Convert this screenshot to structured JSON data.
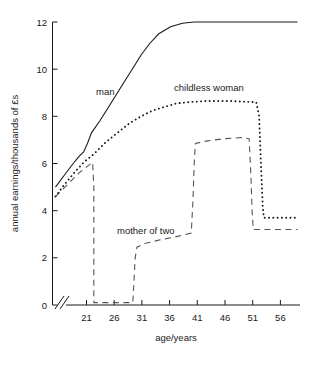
{
  "chart_data": {
    "type": "line",
    "title": "",
    "xlabel": "age/years",
    "ylabel": "annual earnings/thousands of £s",
    "xlim": [
      18,
      60
    ],
    "ylim": [
      0,
      12
    ],
    "xticks": [
      21,
      26,
      31,
      36,
      41,
      46,
      51,
      56
    ],
    "yticks": [
      0,
      2,
      4,
      6,
      8,
      10,
      12
    ],
    "grid": false,
    "legend": "inline-annotations",
    "axis_break": "x-axis broken between origin and first tick",
    "annotations": [
      {
        "text": "man",
        "x": 27.5,
        "y": 9.2
      },
      {
        "text": "childless woman",
        "x": 43.5,
        "y": 9.9
      },
      {
        "text": "mother of two",
        "x": 32.5,
        "y": 3.6
      }
    ],
    "series": [
      {
        "name": "man",
        "style": "solid",
        "points": [
          [
            18.5,
            5.0
          ],
          [
            20.0,
            5.5
          ],
          [
            21.5,
            6.0
          ],
          [
            22.5,
            6.3
          ],
          [
            23.3,
            6.5
          ],
          [
            24.0,
            6.9
          ],
          [
            24.6,
            7.3
          ],
          [
            26.0,
            7.8
          ],
          [
            28.0,
            8.6
          ],
          [
            30.0,
            9.4
          ],
          [
            31.5,
            10.0
          ],
          [
            33.0,
            10.6
          ],
          [
            34.5,
            11.1
          ],
          [
            36.0,
            11.5
          ],
          [
            38.0,
            11.8
          ],
          [
            40.0,
            11.95
          ],
          [
            42.0,
            12.0
          ],
          [
            46.0,
            12.0
          ],
          [
            52.0,
            12.0
          ],
          [
            59.5,
            12.0
          ]
        ]
      },
      {
        "name": "childless woman",
        "style": "dotted",
        "points": [
          [
            18.5,
            4.6
          ],
          [
            20.0,
            5.1
          ],
          [
            22.0,
            5.7
          ],
          [
            23.5,
            6.1
          ],
          [
            25.0,
            6.4
          ],
          [
            27.0,
            6.9
          ],
          [
            29.0,
            7.3
          ],
          [
            31.0,
            7.7
          ],
          [
            33.0,
            8.0
          ],
          [
            35.0,
            8.25
          ],
          [
            37.0,
            8.4
          ],
          [
            39.0,
            8.55
          ],
          [
            41.0,
            8.6
          ],
          [
            44.0,
            8.65
          ],
          [
            48.0,
            8.65
          ],
          [
            52.5,
            8.6
          ],
          [
            53.0,
            8.0
          ],
          [
            53.3,
            6.0
          ],
          [
            53.6,
            4.2
          ],
          [
            53.8,
            3.7
          ],
          [
            55.0,
            3.7
          ],
          [
            59.5,
            3.7
          ]
        ]
      },
      {
        "name": "mother of two",
        "style": "dashed",
        "points": [
          [
            18.5,
            4.6
          ],
          [
            20.5,
            5.1
          ],
          [
            22.5,
            5.6
          ],
          [
            24.0,
            5.9
          ],
          [
            24.8,
            6.05
          ],
          [
            25.0,
            5.0
          ],
          [
            25.0,
            2.0
          ],
          [
            25.0,
            0.1
          ],
          [
            26.0,
            0.1
          ],
          [
            29.0,
            0.1
          ],
          [
            31.0,
            0.1
          ],
          [
            31.6,
            0.1
          ],
          [
            31.8,
            1.0
          ],
          [
            32.0,
            2.0
          ],
          [
            32.3,
            2.45
          ],
          [
            33.5,
            2.6
          ],
          [
            36.0,
            2.75
          ],
          [
            39.0,
            2.9
          ],
          [
            41.5,
            3.05
          ],
          [
            41.8,
            4.5
          ],
          [
            42.0,
            6.0
          ],
          [
            42.2,
            6.85
          ],
          [
            44.0,
            6.95
          ],
          [
            47.0,
            7.05
          ],
          [
            50.0,
            7.1
          ],
          [
            51.3,
            7.05
          ],
          [
            51.6,
            5.5
          ],
          [
            51.8,
            4.0
          ],
          [
            52.0,
            3.2
          ],
          [
            54.0,
            3.2
          ],
          [
            59.5,
            3.2
          ]
        ]
      }
    ]
  },
  "axes": {
    "y_title": "annual earnings/thousands of £s",
    "x_title": "age/years",
    "y_tick_labels": [
      "0",
      "2",
      "4",
      "6",
      "8",
      "10",
      "12"
    ],
    "x_tick_labels": [
      "21",
      "26",
      "31",
      "36",
      "41",
      "46",
      "51",
      "56"
    ]
  },
  "labels": {
    "man": "man",
    "childless_woman": "childless woman",
    "mother_of_two": "mother of two"
  },
  "colors": {
    "ink": "#1a1a1a",
    "dashed_ink": "#555555",
    "background": "#ffffff"
  }
}
